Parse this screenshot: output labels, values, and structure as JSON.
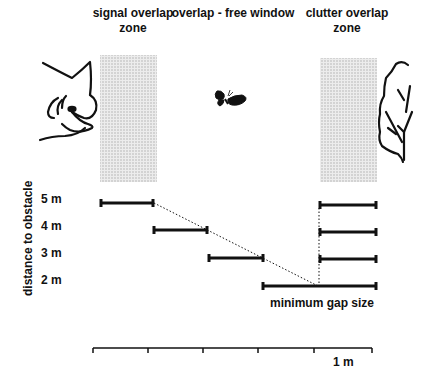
{
  "header": {
    "zones": [
      {
        "id": "signal",
        "line1": "signal overlap",
        "line2": "zone"
      },
      {
        "id": "free",
        "line1": "overlap - free window",
        "line2": ""
      },
      {
        "id": "clutter",
        "line1": "clutter overlap",
        "line2": "zone"
      }
    ]
  },
  "icons": {
    "left": "bat-head-icon",
    "center": "moth-icon",
    "right": "foliage-leaf-icon"
  },
  "axis": {
    "ylabel": "distance to obstacle",
    "ticks": [
      "5 m",
      "4 m",
      "3 m",
      "2 m"
    ]
  },
  "annotations": {
    "gap_label": "minimum gap size",
    "scale_label": "1 m"
  },
  "diagram_data": {
    "signal_overlap_bars": [
      {
        "distance": "5 m",
        "start": 0.0,
        "end": 0.2
      },
      {
        "distance": "4 m",
        "start": 0.2,
        "end": 0.4
      },
      {
        "distance": "3 m",
        "start": 0.4,
        "end": 0.6
      },
      {
        "distance": "2 m",
        "start": 0.6,
        "end": 1.0
      }
    ],
    "clutter_overlap_bars": [
      {
        "distance": "5 m",
        "start": 0.8,
        "end": 1.0
      },
      {
        "distance": "4 m",
        "start": 0.8,
        "end": 1.0
      },
      {
        "distance": "3 m",
        "start": 0.8,
        "end": 1.0
      },
      {
        "distance": "2 m",
        "start": 0.6,
        "end": 1.0
      }
    ],
    "scale_bar": {
      "length": "1 m",
      "divisions": 5
    },
    "colors": {
      "ink": "#111111",
      "zone_fill": "#d6d6d6"
    }
  }
}
